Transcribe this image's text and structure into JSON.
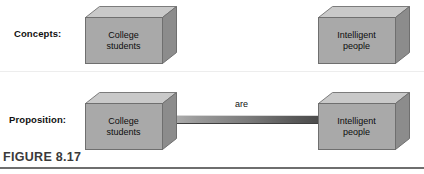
{
  "figure": {
    "caption": "FIGURE 8.17",
    "background_color": "#ffffff",
    "rule_color": "#6e6e6e"
  },
  "rows": [
    {
      "label": "Concepts:",
      "boxes": [
        {
          "line1": "College",
          "line2": "students"
        },
        {
          "line1": "Intelligent",
          "line2": "people"
        }
      ],
      "connector": null
    },
    {
      "label": "Proposition:",
      "boxes": [
        {
          "line1": "College",
          "line2": "students"
        },
        {
          "line1": "Intelligent",
          "line2": "people"
        }
      ],
      "connector": {
        "label": "are"
      }
    }
  ],
  "colors": {
    "box_front": "#a8a8a8",
    "box_top": "#c9c9c9",
    "box_side": "#8a8a8a",
    "box_outline": "#6f6f6f",
    "connector_light": "#b7b7b7",
    "connector_dark": "#4a4a4a",
    "text": "#111111",
    "caption_text": "#3a3a3a",
    "divider": "#ededed"
  }
}
